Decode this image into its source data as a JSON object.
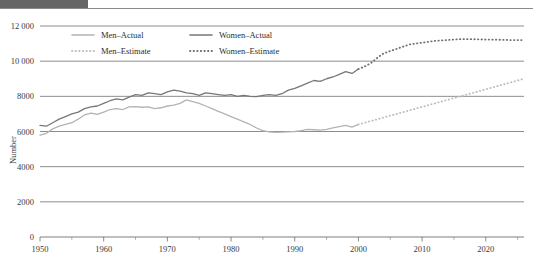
{
  "figure": {
    "header_block_color": "#666666",
    "header_rule_color": "#8a8a8a",
    "background": "#ffffff"
  },
  "chart_data": {
    "type": "line",
    "title": "",
    "subtitle": "",
    "xlabel": "",
    "ylabel": "Number",
    "xlim": [
      1950,
      2026
    ],
    "ylim": [
      0,
      12000
    ],
    "grid": true,
    "grid_axis": "y",
    "legend_position": "top-left-inside",
    "y_ticks": [
      0,
      2000,
      4000,
      6000,
      8000,
      10000,
      12000
    ],
    "y_tick_labels": [
      "0",
      "2000",
      "4000",
      "6000",
      "8000",
      "10 000",
      "12 000"
    ],
    "x_ticks": [
      1950,
      1960,
      1970,
      1980,
      1990,
      2000,
      2010,
      2020
    ],
    "x_tick_labels": [
      "1950",
      "1960",
      "1970",
      "1980",
      "1990",
      "2000",
      "2010",
      "2020"
    ],
    "x_minor_ticks": [
      1955,
      1965,
      1975,
      1985,
      1995,
      2005,
      2015,
      2025
    ],
    "series": [
      {
        "name": "Men–Actual",
        "style": "solid",
        "color": "#b3b3b3",
        "x": [
          1950,
          1951,
          1952,
          1953,
          1954,
          1955,
          1956,
          1957,
          1958,
          1959,
          1960,
          1961,
          1962,
          1963,
          1964,
          1965,
          1966,
          1967,
          1968,
          1969,
          1970,
          1971,
          1972,
          1973,
          1974,
          1975,
          1976,
          1977,
          1978,
          1979,
          1980,
          1981,
          1982,
          1983,
          1984,
          1985,
          1986,
          1987,
          1988,
          1989,
          1990,
          1991,
          1992,
          1993,
          1994,
          1995,
          1996,
          1997,
          1998,
          1999,
          2000
        ],
        "values": [
          5800,
          5900,
          6150,
          6300,
          6400,
          6500,
          6700,
          6950,
          7050,
          6980,
          7100,
          7250,
          7300,
          7250,
          7400,
          7420,
          7380,
          7400,
          7300,
          7350,
          7450,
          7500,
          7600,
          7800,
          7700,
          7600,
          7450,
          7300,
          7150,
          7000,
          6850,
          6700,
          6550,
          6400,
          6200,
          6050,
          5980,
          5950,
          5960,
          5980,
          6000,
          6050,
          6120,
          6100,
          6080,
          6120,
          6200,
          6280,
          6350,
          6250,
          6400
        ]
      },
      {
        "name": "Women–Actual",
        "style": "solid",
        "color": "#777777",
        "x": [
          1950,
          1951,
          1952,
          1953,
          1954,
          1955,
          1956,
          1957,
          1958,
          1959,
          1960,
          1961,
          1962,
          1963,
          1964,
          1965,
          1966,
          1967,
          1968,
          1969,
          1970,
          1971,
          1972,
          1973,
          1974,
          1975,
          1976,
          1977,
          1978,
          1979,
          1980,
          1981,
          1982,
          1983,
          1984,
          1985,
          1986,
          1987,
          1988,
          1989,
          1990,
          1991,
          1992,
          1993,
          1994,
          1995,
          1996,
          1997,
          1998,
          1999,
          2000
        ],
        "values": [
          6350,
          6300,
          6500,
          6700,
          6850,
          7000,
          7100,
          7300,
          7400,
          7450,
          7600,
          7750,
          7850,
          7800,
          7950,
          8100,
          8050,
          8200,
          8150,
          8100,
          8250,
          8350,
          8300,
          8200,
          8150,
          8050,
          8200,
          8150,
          8100,
          8050,
          8100,
          8000,
          8050,
          8000,
          7980,
          8050,
          8100,
          8050,
          8150,
          8350,
          8450,
          8600,
          8750,
          8900,
          8850,
          9000,
          9100,
          9250,
          9400,
          9300,
          9550
        ]
      },
      {
        "name": "Men–Estimate",
        "style": "dotted",
        "color": "#bdbdbd",
        "x": [
          2000,
          2002,
          2004,
          2006,
          2008,
          2010,
          2012,
          2014,
          2016,
          2018,
          2020,
          2022,
          2024,
          2026
        ],
        "values": [
          6400,
          6600,
          6800,
          7000,
          7200,
          7400,
          7600,
          7800,
          8000,
          8200,
          8400,
          8600,
          8800,
          9000
        ]
      },
      {
        "name": "Women–Estimate",
        "style": "dotted",
        "color": "#6e6e6e",
        "x": [
          2000,
          2001,
          2002,
          2003,
          2004,
          2006,
          2008,
          2010,
          2012,
          2014,
          2016,
          2018,
          2020,
          2022,
          2024,
          2026
        ],
        "values": [
          9550,
          9700,
          9900,
          10200,
          10450,
          10700,
          10950,
          11050,
          11150,
          11200,
          11250,
          11250,
          11230,
          11220,
          11200,
          11200
        ]
      }
    ],
    "legend": [
      {
        "label": "Men–Actual",
        "style": "solid",
        "color": "#b3b3b3"
      },
      {
        "label": "Women–Actual",
        "style": "solid",
        "color": "#777777"
      },
      {
        "label": "Men–Estimate",
        "style": "dotted",
        "color": "#bdbdbd"
      },
      {
        "label": "Women–Estimate",
        "style": "dotted",
        "color": "#6e6e6e"
      }
    ]
  }
}
